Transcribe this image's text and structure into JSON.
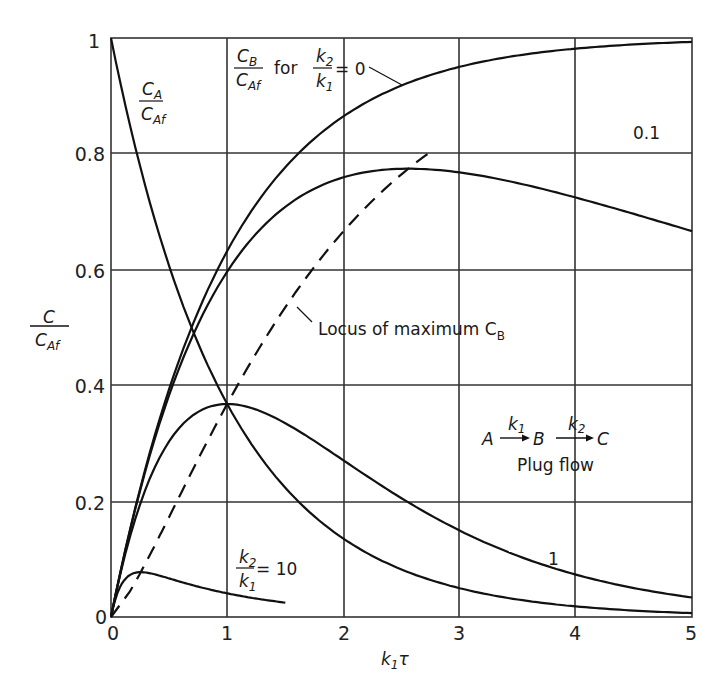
{
  "chart_data": {
    "type": "line",
    "title": "",
    "xlabel": "k1τ",
    "ylabel": "C / CAf",
    "xlim": [
      0,
      5
    ],
    "ylim": [
      0,
      1
    ],
    "grid": true,
    "x_ticks": [
      "0",
      "1",
      "2",
      "3",
      "4",
      "5"
    ],
    "y_ticks": [
      "0",
      "0.2",
      "0.4",
      "0.6",
      "0.8",
      "1"
    ],
    "series": [
      {
        "name": "CA/CAf",
        "style": "solid",
        "x": [
          0,
          0.25,
          0.5,
          1,
          1.5,
          2,
          3,
          4,
          5
        ],
        "values": [
          1.0,
          0.779,
          0.607,
          0.368,
          0.223,
          0.135,
          0.05,
          0.018,
          0.007
        ]
      },
      {
        "name": "CB/CAf for k2/k1 = 0",
        "style": "solid",
        "x": [
          0,
          0.5,
          1,
          1.5,
          2,
          3,
          4,
          5
        ],
        "values": [
          0,
          0.393,
          0.632,
          0.777,
          0.865,
          0.95,
          0.982,
          0.993
        ]
      },
      {
        "name": "k2/k1 = 0.1",
        "style": "solid",
        "x": [
          0,
          0.5,
          1,
          1.5,
          2,
          2.56,
          3,
          4,
          5
        ],
        "values": [
          0,
          0.381,
          0.592,
          0.698,
          0.747,
          0.774,
          0.761,
          0.726,
          0.66
        ]
      },
      {
        "name": "k2/k1 = 1",
        "style": "solid",
        "x": [
          0,
          0.5,
          1,
          1.5,
          2,
          3,
          4,
          5
        ],
        "values": [
          0,
          0.303,
          0.368,
          0.335,
          0.271,
          0.149,
          0.073,
          0.034
        ]
      },
      {
        "name": "k2/k1 = 10",
        "style": "solid",
        "x": [
          0,
          0.1,
          0.256,
          0.5,
          1,
          1.5
        ],
        "values": [
          0,
          0.064,
          0.077,
          0.067,
          0.041,
          0.025
        ]
      },
      {
        "name": "Locus of maximum CB",
        "style": "dashed",
        "x": [
          0,
          0.256,
          0.5,
          1,
          1.5,
          2.56,
          3.5,
          5
        ],
        "values": [
          0,
          0.077,
          0.2,
          0.368,
          0.53,
          0.774,
          0.88,
          0.94
        ]
      }
    ],
    "annotations": [
      "CA / CAf",
      "CB / CAf for k2/k1 = 0",
      "0.1",
      "1",
      "k2/k1 = 10",
      "Locus of maximum CB",
      "A →(k1) B →(k2) C",
      "Plug flow"
    ]
  },
  "labels": {
    "y_axis_num": "C",
    "y_axis_den": "C",
    "y_axis_den_sub": "Af",
    "x_axis_k": "k",
    "x_axis_sub": "1",
    "x_axis_tau": "τ",
    "ca_num": "C",
    "ca_num_sub": "A",
    "ca_den": "C",
    "ca_den_sub": "Af",
    "cb_num": "C",
    "cb_num_sub": "B",
    "cb_den": "C",
    "cb_den_sub": "Af",
    "for": "for",
    "k2": "k",
    "k2_sub": "2",
    "k1": "k",
    "k1_sub": "1",
    "eq0": "= 0",
    "eq10": "= 10",
    "label_01": "0.1",
    "label_1": "1",
    "locus_text": "Locus of maximum C",
    "locus_sub": "B",
    "rxn_A": "A",
    "rxn_B": "B",
    "rxn_C": "C",
    "rxn_k1": "k",
    "rxn_k1_sub": "1",
    "rxn_k2": "k",
    "rxn_k2_sub": "2",
    "plug_flow": "Plug flow",
    "origin_y": "0"
  }
}
